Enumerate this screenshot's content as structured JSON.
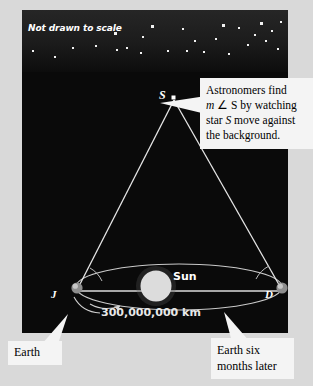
{
  "figure": {
    "kind": "astronomy-parallax-diagram",
    "note": "Not drawn to scale",
    "background_color": "#d9d9d9",
    "sky_color": "#0a0a0a"
  },
  "sky": {
    "note_label": "Not drawn to scale",
    "stars": [
      {
        "x": 10,
        "y": 40,
        "big": false
      },
      {
        "x": 32,
        "y": 46,
        "big": false
      },
      {
        "x": 50,
        "y": 37,
        "big": false
      },
      {
        "x": 73,
        "y": 35,
        "big": false
      },
      {
        "x": 92,
        "y": 22,
        "big": true
      },
      {
        "x": 94,
        "y": 39,
        "big": false
      },
      {
        "x": 104,
        "y": 37,
        "big": false
      },
      {
        "x": 118,
        "y": 42,
        "big": false
      },
      {
        "x": 120,
        "y": 26,
        "big": false
      },
      {
        "x": 129,
        "y": 15,
        "big": true
      },
      {
        "x": 145,
        "y": 40,
        "big": false
      },
      {
        "x": 160,
        "y": 18,
        "big": false
      },
      {
        "x": 164,
        "y": 40,
        "big": false
      },
      {
        "x": 172,
        "y": 30,
        "big": false
      },
      {
        "x": 181,
        "y": 41,
        "big": false
      },
      {
        "x": 193,
        "y": 28,
        "big": false
      },
      {
        "x": 200,
        "y": 14,
        "big": true
      },
      {
        "x": 206,
        "y": 43,
        "big": false
      },
      {
        "x": 216,
        "y": 17,
        "big": false
      },
      {
        "x": 225,
        "y": 34,
        "big": false
      },
      {
        "x": 232,
        "y": 24,
        "big": false
      },
      {
        "x": 238,
        "y": 12,
        "big": true
      },
      {
        "x": 243,
        "y": 30,
        "big": false
      },
      {
        "x": 249,
        "y": 20,
        "big": false
      },
      {
        "x": 255,
        "y": 38,
        "big": false
      },
      {
        "x": 258,
        "y": 11,
        "big": false
      }
    ]
  },
  "diagram": {
    "star_apex": {
      "label": "S",
      "x": 152,
      "y": 88
    },
    "earth_left": {
      "label": "J",
      "x": 55,
      "y": 278
    },
    "earth_right": {
      "label": "D",
      "x": 260,
      "y": 278
    },
    "sun": {
      "label": "Sun",
      "x": 155,
      "y": 276,
      "radius": 16,
      "color": "#d8d8d8"
    },
    "baseline_label": "300,000,000 km",
    "line_color": "#e0e0e0",
    "orbit_color": "#cccccc"
  },
  "callouts": {
    "astronomers": {
      "line1_a": "Astronomers find",
      "line2_a": "m ",
      "line2_b": "∠ S",
      "line2_c": " by watching",
      "line3_a": "star ",
      "line3_b": "S",
      "line3_c": " move against",
      "line4_a": "the background."
    },
    "earth": {
      "text": "Earth"
    },
    "earth_six_months": {
      "line1": "Earth six",
      "line2": "months later"
    }
  }
}
